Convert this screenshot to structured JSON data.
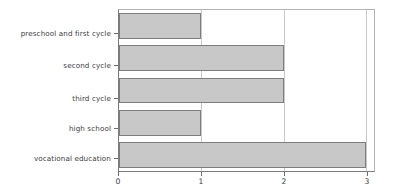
{
  "chart_data": {
    "type": "bar",
    "orientation": "horizontal",
    "title": "",
    "xlabel": "",
    "ylabel": "",
    "categories": [
      "preschool and first cycle",
      "second cycle",
      "third cycle",
      "high school",
      "vocational education"
    ],
    "values": [
      1,
      2,
      2,
      1,
      3
    ],
    "xticks": [
      "0",
      "1",
      "2",
      "3"
    ],
    "xtick_values": [
      0,
      1,
      2,
      3
    ],
    "xlim": [
      0,
      3.1
    ],
    "grid": true,
    "grid_axis": "x",
    "legend": false,
    "bar_fill_color": "#c8c8c8",
    "bar_edge_color": "#7d7d7d",
    "grid_color": "#c9c9c9",
    "axis_color": "#7a7a7a",
    "background_color": "#ffffff"
  }
}
